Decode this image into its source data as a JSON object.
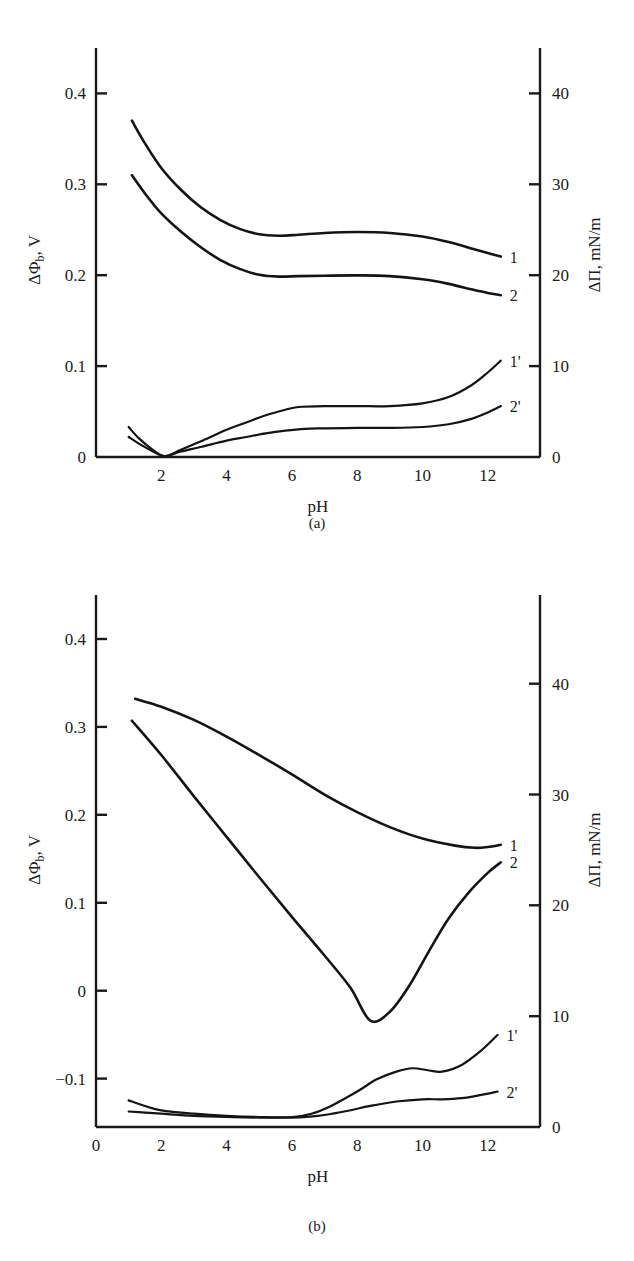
{
  "figure": {
    "panels": [
      {
        "caption": "(a)"
      },
      {
        "caption": "(b)"
      }
    ]
  },
  "chart_data": [
    {
      "panel": "(a)",
      "type": "line",
      "title": "",
      "xlabel": "pH",
      "ylabel": "ΔΦb, V",
      "y2label": "ΔΠ, mN/m",
      "xlim": [
        0,
        13.6
      ],
      "ylim": [
        0,
        0.45
      ],
      "y2lim": [
        0,
        45
      ],
      "xticks": [
        2,
        4,
        6,
        8,
        10,
        12
      ],
      "xticklabels": [
        "2",
        "4",
        "6",
        "8",
        "10",
        "12"
      ],
      "yticks": [
        0,
        0.1,
        0.2,
        0.3,
        0.4
      ],
      "yticklabels": [
        "0",
        "0.1",
        "0.2",
        "0.3",
        "0.4"
      ],
      "y2ticks": [
        0,
        10,
        20,
        30,
        40
      ],
      "y2ticklabels": [
        "0",
        "10",
        "20",
        "30",
        "40"
      ],
      "grid": false,
      "legend_position": "right-inline",
      "series": [
        {
          "name": "1",
          "label": "1",
          "axis": "left",
          "x": [
            1.1,
            1.5,
            2.0,
            2.6,
            3.2,
            3.8,
            4.4,
            5.0,
            5.6,
            6.2,
            7.0,
            8.0,
            9.0,
            10.0,
            10.8,
            11.5,
            12.0,
            12.4
          ],
          "y": [
            0.37,
            0.345,
            0.318,
            0.294,
            0.275,
            0.261,
            0.251,
            0.245,
            0.2435,
            0.2445,
            0.2465,
            0.2475,
            0.2465,
            0.2425,
            0.2365,
            0.2295,
            0.2245,
            0.2205
          ]
        },
        {
          "name": "2",
          "label": "2",
          "axis": "left",
          "x": [
            1.1,
            1.5,
            2.0,
            2.6,
            3.2,
            3.8,
            4.4,
            5.0,
            5.6,
            6.2,
            7.0,
            8.0,
            9.0,
            10.0,
            10.8,
            11.5,
            12.0,
            12.4
          ],
          "y": [
            0.31,
            0.29,
            0.268,
            0.248,
            0.231,
            0.217,
            0.207,
            0.2005,
            0.1985,
            0.199,
            0.1995,
            0.1998,
            0.199,
            0.1955,
            0.1905,
            0.1845,
            0.1805,
            0.178
          ]
        },
        {
          "name": "1'",
          "label": "1'",
          "axis": "right",
          "x": [
            1.0,
            1.3,
            1.7,
            2.1,
            2.6,
            3.2,
            4.0,
            4.6,
            5.2,
            5.8,
            6.2,
            7.0,
            8.0,
            9.0,
            10.0,
            10.8,
            11.5,
            12.0,
            12.4
          ],
          "y": [
            3.3,
            2.1,
            0.9,
            0.1,
            0.8,
            1.7,
            3.0,
            3.8,
            4.6,
            5.2,
            5.5,
            5.6,
            5.6,
            5.6,
            5.9,
            6.6,
            7.9,
            9.3,
            10.6
          ]
        },
        {
          "name": "2'",
          "label": "2'",
          "axis": "right",
          "x": [
            1.0,
            1.3,
            1.7,
            2.1,
            2.6,
            3.2,
            4.0,
            4.6,
            5.2,
            5.8,
            6.4,
            7.0,
            8.0,
            9.0,
            10.0,
            10.8,
            11.5,
            12.0,
            12.4
          ],
          "y": [
            2.2,
            1.5,
            0.7,
            0.1,
            0.6,
            1.1,
            1.8,
            2.2,
            2.6,
            2.9,
            3.1,
            3.15,
            3.2,
            3.2,
            3.3,
            3.6,
            4.2,
            4.9,
            5.6
          ]
        }
      ]
    },
    {
      "panel": "(b)",
      "type": "line",
      "title": "",
      "xlabel": "pH",
      "ylabel": "ΔΦb, V",
      "y2label": "ΔΠ, mN/m",
      "xlim": [
        0,
        13.6
      ],
      "ylim": [
        -0.155,
        0.45
      ],
      "y2lim": [
        0,
        48
      ],
      "xticks": [
        0,
        2,
        4,
        6,
        8,
        10,
        12
      ],
      "xticklabels": [
        "0",
        "2",
        "4",
        "6",
        "8",
        "10",
        "12"
      ],
      "yticks": [
        -0.1,
        0,
        0.1,
        0.2,
        0.3,
        0.4
      ],
      "yticklabels": [
        "−0.1",
        "0",
        "0.1",
        "0.2",
        "0.3",
        "0.4"
      ],
      "y2ticks": [
        0,
        10,
        20,
        30,
        40
      ],
      "y2ticklabels": [
        "0",
        "10",
        "20",
        "30",
        "40"
      ],
      "grid": false,
      "legend_position": "right-inline",
      "series": [
        {
          "name": "1",
          "label": "1",
          "axis": "left",
          "x": [
            1.2,
            2.0,
            3.0,
            4.0,
            5.0,
            6.0,
            7.0,
            8.0,
            9.0,
            10.0,
            11.0,
            11.6,
            12.0,
            12.4
          ],
          "y": [
            0.332,
            0.323,
            0.308,
            0.289,
            0.268,
            0.246,
            0.223,
            0.203,
            0.186,
            0.173,
            0.165,
            0.1625,
            0.1635,
            0.166
          ]
        },
        {
          "name": "2",
          "label": "2",
          "axis": "left",
          "x": [
            1.1,
            2.0,
            3.0,
            4.0,
            5.0,
            6.0,
            7.0,
            7.8,
            8.4,
            9.0,
            9.6,
            10.2,
            10.8,
            11.4,
            12.0,
            12.4
          ],
          "y": [
            0.307,
            0.268,
            0.221,
            0.175,
            0.129,
            0.084,
            0.04,
            0.003,
            -0.034,
            -0.024,
            0.006,
            0.045,
            0.082,
            0.111,
            0.134,
            0.146
          ]
        },
        {
          "name": "1'",
          "label": "1'",
          "axis": "right",
          "x": [
            1.0,
            1.5,
            2.0,
            3.0,
            4.0,
            5.0,
            6.0,
            6.6,
            7.2,
            8.0,
            8.6,
            9.2,
            9.7,
            10.2,
            10.6,
            11.2,
            11.8,
            12.3
          ],
          "y": [
            2.4,
            1.9,
            1.5,
            1.2,
            1.0,
            0.9,
            0.9,
            1.2,
            1.9,
            3.2,
            4.3,
            5.0,
            5.3,
            5.1,
            5.0,
            5.6,
            6.9,
            8.3
          ]
        },
        {
          "name": "2'",
          "label": "2'",
          "axis": "right",
          "x": [
            1.0,
            1.5,
            2.0,
            3.0,
            4.0,
            5.0,
            6.0,
            6.8,
            7.6,
            8.4,
            9.2,
            10.0,
            10.6,
            11.2,
            11.8,
            12.3
          ],
          "y": [
            1.4,
            1.3,
            1.2,
            1.0,
            0.9,
            0.85,
            0.85,
            1.0,
            1.4,
            1.9,
            2.3,
            2.5,
            2.5,
            2.6,
            2.9,
            3.2
          ]
        }
      ]
    }
  ]
}
